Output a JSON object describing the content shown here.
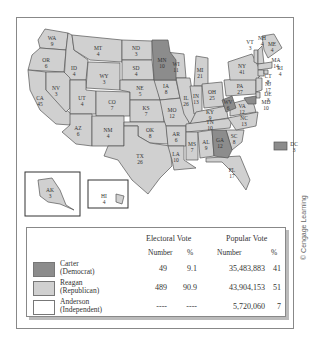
{
  "map": {
    "title": "1980 Presidential Election",
    "colors": {
      "carter": "#8c8c8c",
      "reagan": "#d0d0d0",
      "anderson": "#ffffff"
    },
    "states": [
      {
        "abbr": "WA",
        "ev": "9"
      },
      {
        "abbr": "OR",
        "ev": "6"
      },
      {
        "abbr": "CA",
        "ev": "45"
      },
      {
        "abbr": "ID",
        "ev": "4"
      },
      {
        "abbr": "NV",
        "ev": "3"
      },
      {
        "abbr": "MT",
        "ev": "4"
      },
      {
        "abbr": "WY",
        "ev": "3"
      },
      {
        "abbr": "UT",
        "ev": "4"
      },
      {
        "abbr": "AZ",
        "ev": "6"
      },
      {
        "abbr": "CO",
        "ev": "7"
      },
      {
        "abbr": "NM",
        "ev": "4"
      },
      {
        "abbr": "ND",
        "ev": "3"
      },
      {
        "abbr": "SD",
        "ev": "4"
      },
      {
        "abbr": "NE",
        "ev": "5"
      },
      {
        "abbr": "KS",
        "ev": "7"
      },
      {
        "abbr": "OK",
        "ev": "8"
      },
      {
        "abbr": "TX",
        "ev": "26"
      },
      {
        "abbr": "MN",
        "ev": "10"
      },
      {
        "abbr": "IA",
        "ev": "8"
      },
      {
        "abbr": "MO",
        "ev": "12"
      },
      {
        "abbr": "AR",
        "ev": "6"
      },
      {
        "abbr": "LA",
        "ev": "10"
      },
      {
        "abbr": "WI",
        "ev": "11"
      },
      {
        "abbr": "IL",
        "ev": "26"
      },
      {
        "abbr": "MI",
        "ev": "21"
      },
      {
        "abbr": "IN",
        "ev": "13"
      },
      {
        "abbr": "OH",
        "ev": "25"
      },
      {
        "abbr": "KY",
        "ev": "9"
      },
      {
        "abbr": "TN",
        "ev": "10"
      },
      {
        "abbr": "MS",
        "ev": "7"
      },
      {
        "abbr": "AL",
        "ev": "9"
      },
      {
        "abbr": "GA",
        "ev": "12"
      },
      {
        "abbr": "FL",
        "ev": "17"
      },
      {
        "abbr": "SC",
        "ev": "8"
      },
      {
        "abbr": "NC",
        "ev": "13"
      },
      {
        "abbr": "VA",
        "ev": "12"
      },
      {
        "abbr": "WV",
        "ev": "6"
      },
      {
        "abbr": "PA",
        "ev": "27"
      },
      {
        "abbr": "NY",
        "ev": "41"
      },
      {
        "abbr": "VT",
        "ev": "3"
      },
      {
        "abbr": "NH",
        "ev": "4"
      },
      {
        "abbr": "ME",
        "ev": "4"
      },
      {
        "abbr": "MA",
        "ev": "14"
      },
      {
        "abbr": "RI",
        "ev": "4"
      },
      {
        "abbr": "CT",
        "ev": "8"
      },
      {
        "abbr": "NJ",
        "ev": "17"
      },
      {
        "abbr": "DE",
        "ev": "3"
      },
      {
        "abbr": "MD",
        "ev": "10"
      },
      {
        "abbr": "DC",
        "ev": "3"
      },
      {
        "abbr": "AK",
        "ev": "3"
      },
      {
        "abbr": "HI",
        "ev": "4"
      }
    ]
  },
  "legend": {
    "electoral_header": "Electoral Vote",
    "popular_header": "Popular Vote",
    "number_label": "Number",
    "percent_label": "%",
    "rows": [
      {
        "name": "Carter",
        "party": "(Democrat)",
        "ev_num": "49",
        "ev_pct": "9.1",
        "pop_num": "35,483,883",
        "pop_pct": "41"
      },
      {
        "name": "Reagan",
        "party": "(Republican)",
        "ev_num": "489",
        "ev_pct": "90.9",
        "pop_num": "43,904,153",
        "pop_pct": "51"
      },
      {
        "name": "Anderson",
        "party": "(Independent)",
        "ev_num": "----",
        "ev_pct": "----",
        "pop_num": "5,720,060",
        "pop_pct": "7"
      }
    ]
  },
  "credit": "© Cengage Learning"
}
